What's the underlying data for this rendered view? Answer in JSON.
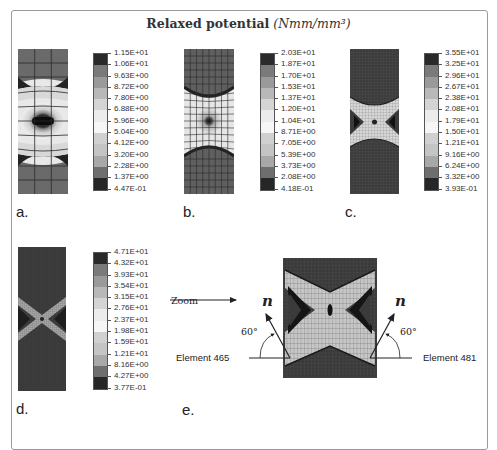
{
  "figure": {
    "title_bold": "Relaxed potential",
    "title_units": "(Nmm/mm³)"
  },
  "panels": [
    {
      "label": "a.",
      "mesh": "coarse",
      "legend": [
        "1.15E+01",
        "1.06E+01",
        "9.63E+00",
        "8.72E+00",
        "7.80E+00",
        "6.88E+00",
        "5.96E+00",
        "5.04E+00",
        "4.12E+00",
        "3.20E+00",
        "2.28E+00",
        "1.37E+00",
        "4.47E-01"
      ]
    },
    {
      "label": "b.",
      "mesh": "medium",
      "legend": [
        "2.03E+01",
        "1.87E+01",
        "1.70E+01",
        "1.53E+01",
        "1.37E+01",
        "1.20E+01",
        "1.04E+01",
        "8.71E+00",
        "7.05E+00",
        "5.39E+00",
        "3.73E+00",
        "2.08E+00",
        "4.18E-01"
      ]
    },
    {
      "label": "c.",
      "mesh": "fine",
      "legend": [
        "3.55E+01",
        "3.25E+01",
        "2.96E+01",
        "2.67E+01",
        "2.38E+01",
        "2.08E+01",
        "1.79E+01",
        "1.50E+01",
        "1.21E+01",
        "9.16E+00",
        "6.24E+00",
        "3.32E+00",
        "3.93E-01"
      ]
    },
    {
      "label": "d.",
      "mesh": "very-fine",
      "legend": [
        "4.71E+01",
        "4.32E+01",
        "3.93E+01",
        "3.54E+01",
        "3.15E+01",
        "2.76E+01",
        "2.37E+01",
        "1.98E+01",
        "1.59E+01",
        "1.21E+01",
        "8.16E+00",
        "4.27E+00",
        "3.77E-01"
      ]
    },
    {
      "label": "e.",
      "mesh": "zoom-detail"
    }
  ],
  "legend_colors": [
    "#2a2a2a",
    "#7a7a7a",
    "#9a9a9a",
    "#b8b8b8",
    "#d4d4d4",
    "#ececec",
    "#f6f6f6",
    "#d0d0d0",
    "#c4c4c4",
    "#a8a8a8",
    "#6e6e6e",
    "#262626",
    "#5e5e5e"
  ],
  "zoom_panel": {
    "zoom_label": "Zoom",
    "left_element": "Element 465",
    "right_element": "Element 481",
    "left_angle": "60°",
    "right_angle": "60°",
    "normal_symbol": "n"
  }
}
